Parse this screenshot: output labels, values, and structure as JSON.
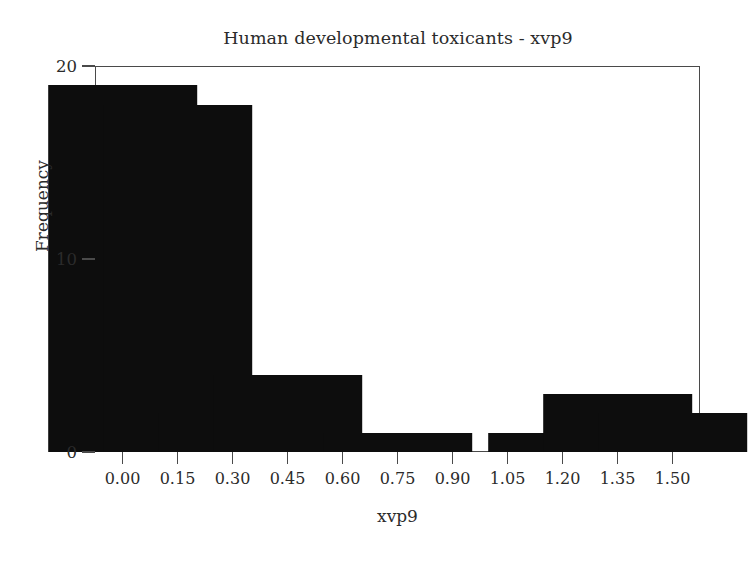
{
  "chart_data": {
    "type": "bar",
    "title": "Human developmental toxicants - xvp9",
    "xlabel": "xvp9",
    "ylabel": "Frequency",
    "categories": [
      "0.00",
      "0.15",
      "0.30",
      "0.45",
      "0.60",
      "0.75",
      "0.90",
      "1.05",
      "1.20",
      "1.35",
      "1.50"
    ],
    "values": [
      19,
      18,
      2,
      4,
      0,
      1,
      0,
      0,
      1,
      3,
      2
    ],
    "x_tick_labels": [
      "0.00",
      "0.15",
      "0.30",
      "0.45",
      "0.60",
      "0.75",
      "0.90",
      "1.05",
      "1.20",
      "1.35",
      "1.50"
    ],
    "x_tick_values": [
      0.0,
      0.15,
      0.3,
      0.45,
      0.6,
      0.75,
      0.9,
      1.05,
      1.2,
      1.35,
      1.5
    ],
    "y_tick_labels": [
      "0",
      "10",
      "20"
    ],
    "y_tick_values": [
      0,
      10,
      20
    ],
    "xlim": [
      -0.075,
      1.575
    ],
    "ylim": [
      0,
      20
    ],
    "grid": false,
    "legend": null,
    "bar_color": "#0d0d0d",
    "frame_color": "#4a4a4a",
    "background_color": "#ffffff",
    "bar_width": 0.068
  }
}
